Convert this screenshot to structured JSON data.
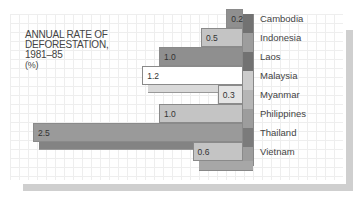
{
  "chart_data": {
    "type": "bar",
    "orientation": "horizontal",
    "title": "ANNUAL RATE OF DEFORESTATION, 1981–85",
    "unit_label": "(%)",
    "categories": [
      "Cambodia",
      "Indonesia",
      "Laos",
      "Malaysia",
      "Myanmar",
      "Philippines",
      "Thailand",
      "Vietnam"
    ],
    "values": [
      0.2,
      0.5,
      1.0,
      1.2,
      0.3,
      1.0,
      2.5,
      0.6
    ],
    "value_labels": [
      "0.2",
      "0.5",
      "1.0",
      "1.2",
      "0.3",
      "1.0",
      "2.5",
      "0.6"
    ],
    "colors": [
      "#8f8f8f",
      "#c4c4c4",
      "#8f8f8f",
      "#ffffff",
      "#e4e4e4",
      "#c4c4c4",
      "#9a9a9a",
      "#c4c4c4"
    ],
    "grid": true,
    "style": "3d-stacked-slabs"
  },
  "title": {
    "line1": "ANNUAL RATE OF",
    "line2": "DEFORESTATION,",
    "line3": "1981–85",
    "unit": "(%)"
  }
}
